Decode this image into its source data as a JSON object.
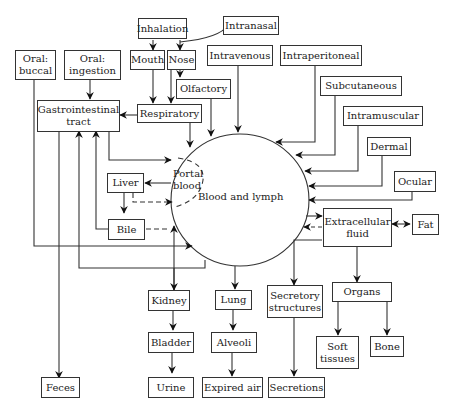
{
  "diagram": {
    "center": {
      "label": "Blood and lymph",
      "portal_label": "Portal\nblood"
    },
    "boxes": {
      "inhalation": "Inhalation",
      "intranasal": "Intranasal",
      "mouth": "Mouth",
      "nose": "Nose",
      "oral_buccal": "Oral:\nbuccal",
      "oral_ingestion": "Oral:\ningestion",
      "intravenous": "Intravenous",
      "intraperitoneal": "Intraperitoneal",
      "olfactory": "Olfactory",
      "subcutaneous": "Subcutaneous",
      "gi_tract": "Gastrointestinal\ntract",
      "respiratory": "Respiratory",
      "intramuscular": "Intramuscular",
      "dermal": "Dermal",
      "ocular": "Ocular",
      "liver": "Liver",
      "bile": "Bile",
      "extracellular_fluid": "Extracellular\nfluid",
      "fat": "Fat",
      "kidney": "Kidney",
      "lung": "Lung",
      "secretory_structures": "Secretory\nstructures",
      "organs": "Organs",
      "bladder": "Bladder",
      "alveoli": "Alveoli",
      "soft_tissues": "Soft\ntissues",
      "bone": "Bone",
      "feces": "Feces",
      "urine": "Urine",
      "expired_air": "Expired air",
      "secretions": "Secretions"
    }
  }
}
